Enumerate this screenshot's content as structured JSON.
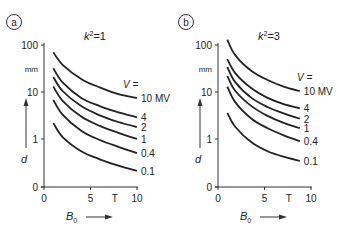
{
  "chart_data": [
    {
      "type": "line",
      "panel_label": "a",
      "title": "k²=1",
      "title_base": "k",
      "title_sup": "2",
      "title_rest": "=1",
      "xlabel": "B0",
      "xlabel_base": "B",
      "xlabel_sub": "0",
      "x_unit": "T",
      "ylabel": "d",
      "y_unit": "mm",
      "yscale": "log (with 0 baseline)",
      "x_ticks": [
        "0",
        "5",
        "10"
      ],
      "y_ticks": [
        "0",
        "1",
        "10",
        "100"
      ],
      "xlim": [
        0,
        10
      ],
      "ylim": [
        0,
        100
      ],
      "legend_header": "V =",
      "series": [
        {
          "name": "10 MV",
          "x": [
            1,
            2,
            4,
            6,
            8,
            10
          ],
          "values": [
            70,
            38,
            19,
            12.5,
            9,
            7.4
          ]
        },
        {
          "name": "4",
          "x": [
            1,
            2,
            4,
            6,
            8,
            10
          ],
          "values": [
            32,
            16,
            7.5,
            5,
            3.7,
            2.9
          ]
        },
        {
          "name": "2",
          "x": [
            1,
            2,
            4,
            6,
            8,
            10
          ],
          "values": [
            21,
            10.5,
            5,
            3.2,
            2.3,
            1.8
          ]
        },
        {
          "name": "1",
          "x": [
            1,
            2,
            4,
            6,
            8,
            10
          ],
          "values": [
            13,
            6.5,
            3,
            1.9,
            1.35,
            1.0
          ]
        },
        {
          "name": "0.4",
          "x": [
            1,
            2,
            4,
            6,
            8,
            10
          ],
          "values": [
            6.8,
            3.3,
            1.5,
            0.95,
            0.68,
            0.5
          ]
        },
        {
          "name": "0.1",
          "x": [
            1,
            2,
            4,
            6,
            8,
            10
          ],
          "values": [
            2.2,
            1.1,
            0.55,
            0.37,
            0.27,
            0.21
          ]
        }
      ]
    },
    {
      "type": "line",
      "panel_label": "b",
      "title": "k²=3",
      "title_base": "k",
      "title_sup": "2",
      "title_rest": "=3",
      "xlabel": "B0",
      "xlabel_base": "B",
      "xlabel_sub": "0",
      "x_unit": "T",
      "ylabel": "d",
      "y_unit": "mm",
      "yscale": "log (with 0 baseline)",
      "x_ticks": [
        "0",
        "5",
        "10"
      ],
      "y_ticks": [
        "0",
        "1",
        "10",
        "100"
      ],
      "xlim": [
        0,
        10
      ],
      "ylim": [
        0,
        100
      ],
      "legend_header": "V =",
      "series": [
        {
          "name": "10 MV",
          "x": [
            1,
            2,
            4,
            6,
            8,
            10
          ],
          "values": [
            130,
            60,
            28,
            18,
            13,
            10.5
          ]
        },
        {
          "name": "4",
          "x": [
            1,
            2,
            4,
            6,
            8,
            10
          ],
          "values": [
            50,
            25,
            12,
            7.5,
            5.5,
            4.5
          ]
        },
        {
          "name": "2",
          "x": [
            1,
            2,
            4,
            6,
            8,
            10
          ],
          "values": [
            34,
            16,
            7.5,
            4.8,
            3.5,
            2.7
          ]
        },
        {
          "name": "1",
          "x": [
            1,
            2,
            4,
            6,
            8,
            10
          ],
          "values": [
            22,
            10.5,
            5,
            3.1,
            2.2,
            1.7
          ]
        },
        {
          "name": "0.4",
          "x": [
            1,
            2,
            4,
            6,
            8,
            10
          ],
          "values": [
            13,
            6,
            2.7,
            1.7,
            1.2,
            0.9
          ]
        },
        {
          "name": "0.1",
          "x": [
            1,
            2,
            4,
            6,
            8,
            10
          ],
          "values": [
            3.6,
            1.8,
            0.85,
            0.55,
            0.42,
            0.34
          ]
        }
      ]
    }
  ]
}
